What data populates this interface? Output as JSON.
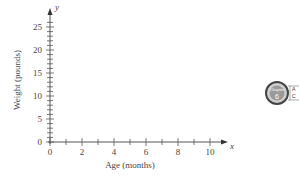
{
  "chart_data": {
    "type": "scatter",
    "title": "",
    "xlabel": "Age (months)",
    "ylabel": "Weight (pounds)",
    "x_axis_var": "x",
    "y_axis_var": "y",
    "xlim": [
      0,
      10
    ],
    "ylim": [
      0,
      25
    ],
    "x_ticks": [
      0,
      1,
      2,
      3,
      4,
      5,
      6,
      7,
      8,
      9,
      10
    ],
    "x_tick_labels": [
      "0",
      "2",
      "4",
      "6",
      "8",
      "10"
    ],
    "y_ticks_minor_step": 1,
    "y_tick_labels": [
      "0",
      "5",
      "10",
      "15",
      "20",
      "25"
    ],
    "grid": false,
    "series": []
  },
  "badge": {
    "label": "Chapter",
    "number": "6",
    "side_text": [
      "A",
      "C"
    ]
  }
}
